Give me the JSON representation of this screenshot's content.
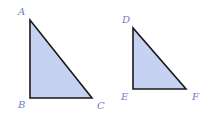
{
  "diagram": {
    "type": "similar-triangles",
    "colors": {
      "fill": "#c5d2f2",
      "stroke": "#1a1a1a",
      "label": "#6a7fc0"
    },
    "triangles": [
      {
        "name": "ABC",
        "vertices": {
          "A": {
            "label": "A",
            "x": 30,
            "y": 20
          },
          "B": {
            "label": "B",
            "x": 30,
            "y": 98
          },
          "C": {
            "label": "C",
            "x": 92,
            "y": 98
          }
        },
        "right_angle_at": "B"
      },
      {
        "name": "DEF",
        "vertices": {
          "D": {
            "label": "D",
            "x": 133,
            "y": 28
          },
          "E": {
            "label": "E",
            "x": 133,
            "y": 89
          },
          "F": {
            "label": "F",
            "x": 186,
            "y": 89
          }
        },
        "right_angle_at": "E"
      }
    ]
  }
}
